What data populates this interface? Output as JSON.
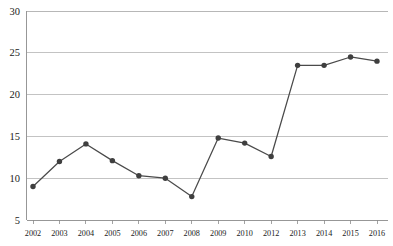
{
  "chart_data": {
    "type": "line",
    "title": "",
    "xlabel": "",
    "ylabel": "",
    "categories": [
      "2002",
      "2003",
      "2004",
      "2005",
      "2006",
      "2007",
      "2008",
      "2009",
      "2010",
      "2012",
      "2013",
      "2014",
      "2015",
      "2016"
    ],
    "values": [
      9.0,
      12.0,
      14.1,
      12.1,
      10.3,
      10.0,
      7.8,
      14.8,
      14.2,
      12.6,
      23.5,
      23.5,
      24.5,
      24.0
    ],
    "series": [
      {
        "name": "series-1",
        "values": [
          9.0,
          12.0,
          14.1,
          12.1,
          10.3,
          10.0,
          7.8,
          14.8,
          14.2,
          12.6,
          23.5,
          23.5,
          24.5,
          24.0
        ]
      }
    ],
    "ylim": [
      5,
      30
    ],
    "yticks": [
      5,
      10,
      15,
      20,
      25,
      30
    ],
    "ytick_labels": [
      "5",
      "10",
      "15",
      "20",
      "25",
      "30"
    ],
    "xtick_labels": [
      "2002",
      "2003",
      "2004",
      "2005",
      "2006",
      "2007",
      "2008",
      "2009",
      "2010",
      "2012",
      "2013",
      "2014",
      "2015",
      "2016"
    ],
    "grid": true,
    "grid_axis": "y",
    "legend": false,
    "legend_position": "none",
    "marker": "circle",
    "line_color": "#4a4a4a",
    "marker_color": "#3f3f3f",
    "grid_color": "#b4b4b4",
    "axis_color": "#8c8c8c",
    "background_color": "#ffffff",
    "text_color": "#1a1a1a"
  }
}
